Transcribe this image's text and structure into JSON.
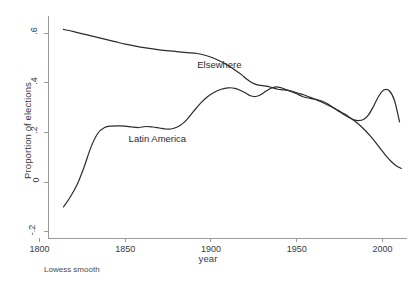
{
  "figure": {
    "note": "Lowess smooth"
  },
  "chart_data": {
    "type": "line",
    "title": "",
    "subtitle": "",
    "xlabel": "year",
    "ylabel": "Proportion of elections",
    "xlim": [
      1805,
      2012
    ],
    "ylim": [
      -0.225,
      0.645
    ],
    "grid": false,
    "legend_position": "inline-annotations",
    "annotations": [
      {
        "text": "Elsewhere",
        "x": 1892,
        "y": 0.468
      },
      {
        "text": "Latin America",
        "x": 1852,
        "y": 0.168
      }
    ],
    "xticks": [
      1800,
      1850,
      1900,
      1950,
      2000
    ],
    "xticklabels": [
      "1800",
      "1850",
      "1900",
      "1950",
      "2000"
    ],
    "yticks": [
      -0.2,
      0,
      0.2,
      0.4,
      0.6
    ],
    "yticklabels": [
      "-.2",
      "0",
      ".2",
      ".4",
      ".6"
    ],
    "series": [
      {
        "name": "Elsewhere",
        "color": "#2b2b2b",
        "x": [
          1814,
          1820,
          1826,
          1832,
          1838,
          1844,
          1850,
          1856,
          1862,
          1868,
          1874,
          1880,
          1886,
          1892,
          1898,
          1904,
          1910,
          1914,
          1918,
          1921,
          1924,
          1927,
          1930,
          1933,
          1936,
          1939,
          1942,
          1945,
          1948,
          1951,
          1954,
          1957,
          1960,
          1963,
          1966,
          1969,
          1972,
          1975,
          1978,
          1981,
          1984,
          1987,
          1990,
          1993,
          1996,
          1999,
          2002,
          2005,
          2008,
          2011
        ],
        "values": [
          0.615,
          0.606,
          0.596,
          0.586,
          0.576,
          0.566,
          0.556,
          0.548,
          0.541,
          0.535,
          0.53,
          0.526,
          0.522,
          0.518,
          0.508,
          0.492,
          0.47,
          0.452,
          0.432,
          0.414,
          0.4,
          0.392,
          0.389,
          0.386,
          0.38,
          0.374,
          0.372,
          0.37,
          0.365,
          0.358,
          0.352,
          0.344,
          0.336,
          0.327,
          0.318,
          0.308,
          0.297,
          0.286,
          0.274,
          0.26,
          0.245,
          0.228,
          0.208,
          0.185,
          0.16,
          0.133,
          0.107,
          0.084,
          0.066,
          0.055
        ]
      },
      {
        "name": "Latin America",
        "color": "#2b2b2b",
        "x": [
          1814,
          1818,
          1822,
          1826,
          1830,
          1834,
          1838,
          1842,
          1846,
          1850,
          1854,
          1858,
          1862,
          1866,
          1870,
          1874,
          1878,
          1882,
          1886,
          1890,
          1894,
          1898,
          1902,
          1906,
          1910,
          1914,
          1917,
          1920,
          1923,
          1926,
          1929,
          1932,
          1935,
          1938,
          1941,
          1944,
          1947,
          1950,
          1953,
          1956,
          1959,
          1962,
          1965,
          1968,
          1971,
          1974,
          1977,
          1980,
          1983,
          1986,
          1989,
          1992,
          1995,
          1998,
          2001,
          2004,
          2007,
          2010
        ],
        "values": [
          -0.1,
          -0.06,
          -0.01,
          0.06,
          0.14,
          0.196,
          0.22,
          0.226,
          0.227,
          0.226,
          0.222,
          0.22,
          0.224,
          0.222,
          0.218,
          0.214,
          0.216,
          0.228,
          0.252,
          0.286,
          0.318,
          0.344,
          0.362,
          0.374,
          0.38,
          0.378,
          0.37,
          0.36,
          0.348,
          0.345,
          0.352,
          0.366,
          0.378,
          0.384,
          0.38,
          0.372,
          0.364,
          0.356,
          0.346,
          0.34,
          0.336,
          0.332,
          0.326,
          0.316,
          0.302,
          0.288,
          0.274,
          0.262,
          0.252,
          0.248,
          0.252,
          0.272,
          0.308,
          0.348,
          0.372,
          0.368,
          0.33,
          0.243
        ]
      }
    ]
  }
}
